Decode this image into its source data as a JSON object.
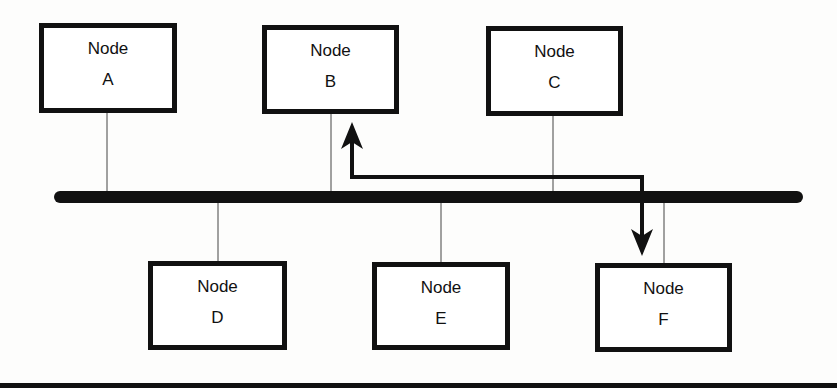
{
  "diagram": {
    "type": "bus-network",
    "bus": {
      "x1": 60,
      "x2": 797,
      "y": 197,
      "thickness": 12,
      "color": "#111111"
    },
    "nodes": [
      {
        "id": "A",
        "line1": "Node",
        "line2": "A",
        "x": 39,
        "y": 23,
        "w": 138,
        "h": 90,
        "row": "top",
        "tap_x": 107
      },
      {
        "id": "B",
        "line1": "Node",
        "line2": "B",
        "x": 262,
        "y": 25,
        "w": 137,
        "h": 89,
        "row": "top",
        "tap_x": 331
      },
      {
        "id": "C",
        "line1": "Node",
        "line2": "C",
        "x": 486,
        "y": 26,
        "w": 137,
        "h": 90,
        "row": "top",
        "tap_x": 553
      },
      {
        "id": "D",
        "line1": "Node",
        "line2": "D",
        "x": 148,
        "y": 261,
        "w": 139,
        "h": 89,
        "row": "bottom",
        "tap_x": 218
      },
      {
        "id": "E",
        "line1": "Node",
        "line2": "E",
        "x": 372,
        "y": 262,
        "w": 138,
        "h": 88,
        "row": "bottom",
        "tap_x": 441
      },
      {
        "id": "F",
        "line1": "Node",
        "line2": "F",
        "x": 595,
        "y": 263,
        "w": 137,
        "h": 89,
        "row": "bottom",
        "tap_x": 664
      }
    ],
    "message_path": {
      "from": "F",
      "to": "B",
      "description": "Arrow path from bus near Node F up to Node B",
      "points": [
        [
          642,
          255
        ],
        [
          642,
          177
        ],
        [
          352,
          177
        ],
        [
          352,
          122
        ]
      ],
      "arrowheads": [
        "up-at-B",
        "down-at-F"
      ]
    }
  }
}
